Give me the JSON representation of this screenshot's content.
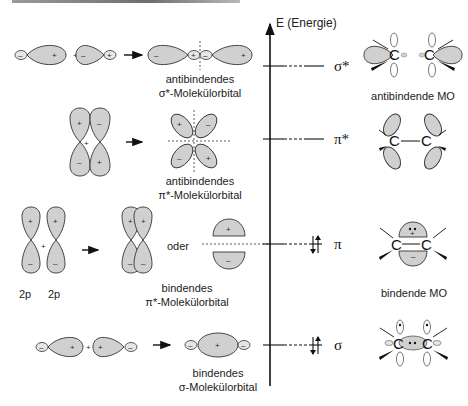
{
  "axis": {
    "label": "E (Energie)"
  },
  "levels": [
    {
      "symbol": "σ*",
      "y": 66,
      "occupied": false
    },
    {
      "symbol": "π*",
      "y": 139,
      "occupied": false
    },
    {
      "symbol": "π",
      "y": 244,
      "occupied": true
    },
    {
      "symbol": "σ",
      "y": 345,
      "occupied": true
    }
  ],
  "rows": {
    "sigma_star": {
      "caption_line1": "antibindendes",
      "caption_line2": "σ*-Molekülorbital",
      "plus": "+",
      "right_label": "antibindende MO"
    },
    "pi_star": {
      "caption_line1": "antibindendes",
      "caption_line2": "π*-Molekülorbital",
      "plus": "+"
    },
    "pi": {
      "caption_line1": "bindendes",
      "caption_line2": "π*-Molekülorbital",
      "atomic_label_1": "2p",
      "atomic_label_2": "2p",
      "or_label": "oder",
      "plus": "+",
      "right_label": "bindende MO"
    },
    "sigma": {
      "caption_line1": "bindendes",
      "caption_line2": "σ-Molekülorbital",
      "plus": "+"
    }
  },
  "signs": {
    "plus": "+",
    "minus": "–"
  },
  "atom": "C",
  "colors": {
    "lobe_fill": "#d0d0d0",
    "stroke": "#333333",
    "background": "#ffffff"
  }
}
